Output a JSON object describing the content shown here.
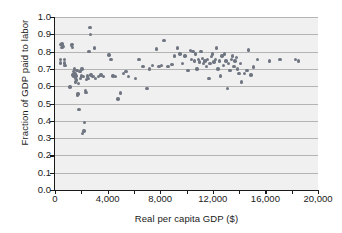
{
  "chart_data": {
    "type": "scatter",
    "title": "",
    "xlabel": "Real per capita GDP ($)",
    "ylabel": "Fraction of GDP paid to labor",
    "xlim": [
      0,
      20000
    ],
    "ylim": [
      0.0,
      1.0
    ],
    "xticks": [
      0,
      4000,
      8000,
      12000,
      16000,
      20000
    ],
    "xtick_labels": [
      "0",
      "4,000",
      "8,000",
      "12,000",
      "16,000",
      "20,000"
    ],
    "xminor_ticks": [
      2000,
      6000,
      10000,
      14000,
      18000
    ],
    "yticks": [
      0.0,
      0.1,
      0.2,
      0.3,
      0.4,
      0.5,
      0.6,
      0.7,
      0.8,
      0.9,
      1.0
    ],
    "ytick_labels": [
      "0.0",
      "0.1",
      "0.2",
      "0.3",
      "0.4",
      "0.5",
      "0.6",
      "0.7",
      "0.8",
      "0.9",
      "1.0"
    ],
    "grid": "horizontal",
    "legend": "none",
    "marker_color": "#6f7581",
    "plot_background": "#f0f0f0",
    "gridline_color": "#b4b4b4",
    "axis_color": "#1a1a1a",
    "points": [
      [
        400,
        0.755
      ],
      [
        420,
        0.735
      ],
      [
        460,
        0.84
      ],
      [
        520,
        0.845
      ],
      [
        540,
        0.825
      ],
      [
        620,
        0.83
      ],
      [
        700,
        0.735
      ],
      [
        720,
        0.755
      ],
      [
        760,
        0.72
      ],
      [
        1150,
        0.595
      ],
      [
        1250,
        0.835
      ],
      [
        1300,
        0.84
      ],
      [
        1320,
        0.825
      ],
      [
        1380,
        0.665
      ],
      [
        1420,
        0.685
      ],
      [
        1450,
        0.655
      ],
      [
        1480,
        0.7
      ],
      [
        1520,
        0.675
      ],
      [
        1560,
        0.645
      ],
      [
        1580,
        0.625
      ],
      [
        1600,
        0.66
      ],
      [
        1640,
        0.635
      ],
      [
        1680,
        0.69
      ],
      [
        1700,
        0.545
      ],
      [
        1750,
        0.555
      ],
      [
        1800,
        0.615
      ],
      [
        1820,
        0.465
      ],
      [
        1900,
        0.685
      ],
      [
        1950,
        0.645
      ],
      [
        2000,
        0.66
      ],
      [
        2050,
        0.7
      ],
      [
        2100,
        0.325
      ],
      [
        2150,
        0.655
      ],
      [
        2200,
        0.34
      ],
      [
        2250,
        0.39
      ],
      [
        2300,
        0.575
      ],
      [
        2350,
        0.565
      ],
      [
        2400,
        0.64
      ],
      [
        2450,
        0.66
      ],
      [
        2500,
        0.645
      ],
      [
        2600,
        0.8
      ],
      [
        2650,
        0.94
      ],
      [
        2700,
        0.9
      ],
      [
        2750,
        0.665
      ],
      [
        2900,
        0.655
      ],
      [
        3000,
        0.82
      ],
      [
        3100,
        0.645
      ],
      [
        3300,
        0.655
      ],
      [
        3500,
        0.665
      ],
      [
        3700,
        0.655
      ],
      [
        4100,
        0.78
      ],
      [
        4250,
        0.755
      ],
      [
        4400,
        0.66
      ],
      [
        4600,
        0.655
      ],
      [
        4800,
        0.525
      ],
      [
        5000,
        0.56
      ],
      [
        5200,
        0.675
      ],
      [
        5400,
        0.685
      ],
      [
        5600,
        0.655
      ],
      [
        6100,
        0.645
      ],
      [
        6400,
        0.755
      ],
      [
        6700,
        0.715
      ],
      [
        7000,
        0.585
      ],
      [
        7200,
        0.7
      ],
      [
        7400,
        0.72
      ],
      [
        7700,
        0.815
      ],
      [
        7900,
        0.715
      ],
      [
        8100,
        0.72
      ],
      [
        8300,
        0.865
      ],
      [
        8600,
        0.715
      ],
      [
        8900,
        0.725
      ],
      [
        9100,
        0.775
      ],
      [
        9300,
        0.82
      ],
      [
        9500,
        0.785
      ],
      [
        9700,
        0.73
      ],
      [
        9900,
        0.775
      ],
      [
        10100,
        0.69
      ],
      [
        10300,
        0.805
      ],
      [
        10400,
        0.755
      ],
      [
        10500,
        0.8
      ],
      [
        10600,
        0.745
      ],
      [
        10700,
        0.785
      ],
      [
        10800,
        0.7
      ],
      [
        10900,
        0.755
      ],
      [
        11000,
        0.74
      ],
      [
        11100,
        0.8
      ],
      [
        11200,
        0.76
      ],
      [
        11300,
        0.73
      ],
      [
        11400,
        0.745
      ],
      [
        11500,
        0.715
      ],
      [
        11600,
        0.755
      ],
      [
        11700,
        0.645
      ],
      [
        11800,
        0.73
      ],
      [
        11900,
        0.77
      ],
      [
        12000,
        0.785
      ],
      [
        12100,
        0.74
      ],
      [
        12200,
        0.755
      ],
      [
        12300,
        0.82
      ],
      [
        12400,
        0.7
      ],
      [
        12500,
        0.745
      ],
      [
        12600,
        0.66
      ],
      [
        12700,
        0.775
      ],
      [
        12800,
        0.72
      ],
      [
        12900,
        0.785
      ],
      [
        13000,
        0.745
      ],
      [
        13100,
        0.585
      ],
      [
        13200,
        0.73
      ],
      [
        13300,
        0.69
      ],
      [
        13400,
        0.755
      ],
      [
        13500,
        0.775
      ],
      [
        13600,
        0.715
      ],
      [
        13700,
        0.745
      ],
      [
        13800,
        0.765
      ],
      [
        13900,
        0.7
      ],
      [
        14000,
        0.675
      ],
      [
        14100,
        0.73
      ],
      [
        14200,
        0.625
      ],
      [
        14400,
        0.675
      ],
      [
        14600,
        0.69
      ],
      [
        14700,
        0.81
      ],
      [
        14900,
        0.665
      ],
      [
        15100,
        0.71
      ],
      [
        15400,
        0.755
      ],
      [
        16300,
        0.745
      ],
      [
        17100,
        0.755
      ],
      [
        18300,
        0.755
      ],
      [
        18500,
        0.745
      ]
    ]
  }
}
